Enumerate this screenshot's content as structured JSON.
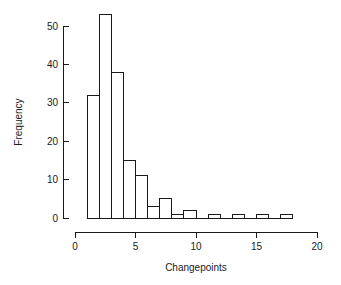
{
  "chart_data": {
    "type": "bar",
    "title": "",
    "subtitle": "",
    "xlabel": "Changepoints",
    "ylabel": "Frequency",
    "xlim": [
      0,
      20
    ],
    "ylim": [
      0,
      53
    ],
    "grid": false,
    "legend": null,
    "bin_width": 1,
    "x_ticks": [
      0,
      5,
      10,
      15,
      20
    ],
    "x_tick_labels": [
      "0",
      "5",
      "10",
      "15",
      "20"
    ],
    "y_ticks": [
      0,
      10,
      20,
      30,
      40,
      50
    ],
    "y_tick_labels": [
      "0",
      "10",
      "20",
      "30",
      "40",
      "50"
    ],
    "bins": [
      {
        "start": 1,
        "end": 2,
        "value": 32
      },
      {
        "start": 2,
        "end": 3,
        "value": 53
      },
      {
        "start": 3,
        "end": 4,
        "value": 38
      },
      {
        "start": 4,
        "end": 5,
        "value": 15
      },
      {
        "start": 5,
        "end": 6,
        "value": 11
      },
      {
        "start": 6,
        "end": 7,
        "value": 3
      },
      {
        "start": 7,
        "end": 8,
        "value": 5
      },
      {
        "start": 8,
        "end": 9,
        "value": 1
      },
      {
        "start": 9,
        "end": 10,
        "value": 2
      },
      {
        "start": 10,
        "end": 11,
        "value": 0
      },
      {
        "start": 11,
        "end": 12,
        "value": 1
      },
      {
        "start": 12,
        "end": 13,
        "value": 0
      },
      {
        "start": 13,
        "end": 14,
        "value": 1
      },
      {
        "start": 14,
        "end": 15,
        "value": 0
      },
      {
        "start": 15,
        "end": 16,
        "value": 1
      },
      {
        "start": 16,
        "end": 17,
        "value": 0
      },
      {
        "start": 17,
        "end": 18,
        "value": 1
      }
    ],
    "categories": [
      "1-2",
      "2-3",
      "3-4",
      "4-5",
      "5-6",
      "6-7",
      "7-8",
      "8-9",
      "9-10",
      "10-11",
      "11-12",
      "12-13",
      "13-14",
      "14-15",
      "15-16",
      "16-17",
      "17-18"
    ],
    "values": [
      32,
      53,
      38,
      15,
      11,
      3,
      5,
      1,
      2,
      0,
      1,
      0,
      1,
      0,
      1,
      0,
      1
    ],
    "colors": {
      "stroke": "#1a1a1a",
      "fill": "none",
      "background": "#ffffff"
    }
  },
  "plot": {
    "geometry": {
      "x_axis_pixel_start": 75,
      "x_axis_pixel_end": 317,
      "y_axis_pixel_zero": 218,
      "y_axis_pixel_top": 26,
      "y_value_at_top": 50,
      "x_axis_line_y": 232,
      "y_axis_line_x": 63
    }
  }
}
